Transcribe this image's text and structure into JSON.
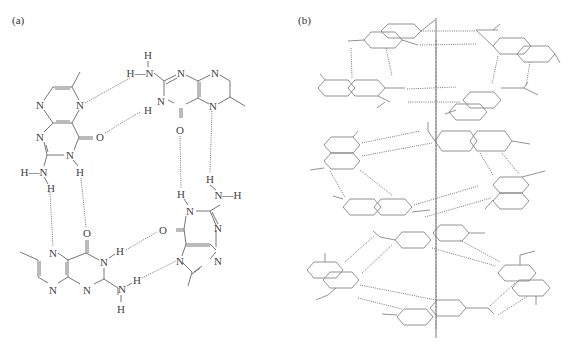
{
  "figure": {
    "panel_a": {
      "label": "(a)",
      "description": "Hydrogen-bonded cyclic tetramer of 6-methylpterin",
      "atoms": {
        "N": "N",
        "H": "H",
        "O": "O",
        "HN": "H—N",
        "NH": "N—H"
      }
    },
    "panel_b": {
      "label": "(b)",
      "description": "Stacked tetramers around a central axis (line drawing)"
    }
  }
}
